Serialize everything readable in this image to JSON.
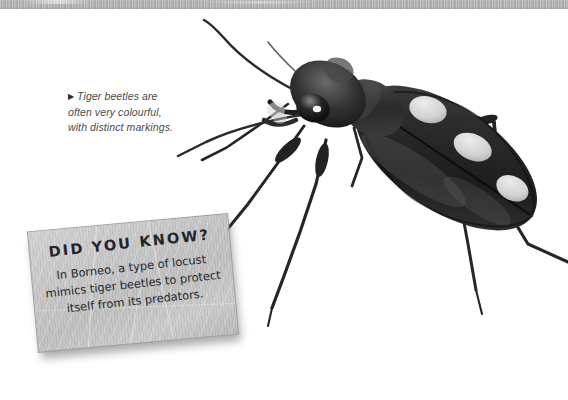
{
  "page": {
    "background_color": "#ffffff",
    "top_band_color": "#b0b0b0"
  },
  "caption": {
    "marker": "▶",
    "line1": "Tiger beetles are",
    "line2": "often very colourful,",
    "line3": "with distinct markings."
  },
  "did_you_know": {
    "title": "DID YOU KNOW?",
    "body": "In Borneo, a type of locust mimics tiger beetles to protect itself from its predators.",
    "panel_color": "#c4c4c4",
    "text_color": "#26272c"
  },
  "photo": {
    "subject": "tiger-beetle",
    "description": "Black-and-white photograph of a tiger beetle with three pale spots on each elytron, long antennae and slender legs.",
    "body_color": "#2b2b2b",
    "spot_color": "#d9d9d9"
  }
}
